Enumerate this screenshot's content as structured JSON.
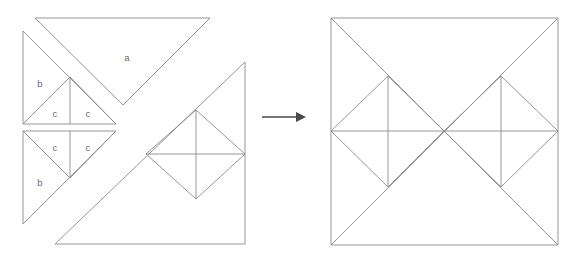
{
  "figure": {
    "stroke_color": "#8a8a8a",
    "label_color": "#6b6b6b",
    "arrow_color": "#4a4a4a",
    "background": "#ffffff",
    "stroke_width": 0.9,
    "width": 583,
    "height": 263
  },
  "labels": {
    "a": "a",
    "b_top": "b",
    "b_bottom": "b",
    "c_top_left": "c",
    "c_top_right": "c",
    "c_bottom_left": "c",
    "c_bottom_right": "c"
  },
  "label_positions": {
    "a": {
      "x": 127,
      "y": 58
    },
    "b_top": {
      "x": 40,
      "y": 84
    },
    "b_bottom": {
      "x": 40,
      "y": 183
    },
    "c_top_left": {
      "x": 55,
      "y": 114
    },
    "c_top_right": {
      "x": 88,
      "y": 114
    },
    "c_bottom_left": {
      "x": 55,
      "y": 148
    },
    "c_bottom_right": {
      "x": 88,
      "y": 148
    }
  },
  "arrow": {
    "name": "transformation-arrow",
    "direction": "right",
    "x1": 262,
    "y1": 117,
    "x2": 306,
    "y2": 117
  },
  "left_figure": {
    "name": "dissected-pieces",
    "triangle_a": [
      [
        35,
        18
      ],
      [
        210,
        18
      ],
      [
        123,
        105
      ]
    ],
    "triangle_b_top": [
      [
        23,
        31
      ],
      [
        23,
        124
      ],
      [
        116,
        124
      ]
    ],
    "triangle_b_bottom": [
      [
        23,
        131
      ],
      [
        23,
        224
      ],
      [
        116,
        131
      ]
    ],
    "c_top_apex": [
      70,
      77
    ],
    "c_top_base": [
      [
        23,
        124
      ],
      [
        116,
        124
      ]
    ],
    "c_top_vertical": [
      [
        70,
        77
      ],
      [
        70,
        124
      ]
    ],
    "c_bottom_apex": [
      70,
      178
    ],
    "c_bottom_base": [
      [
        23,
        131
      ],
      [
        116,
        131
      ]
    ],
    "c_bottom_vertical": [
      [
        70,
        131
      ],
      [
        70,
        178
      ]
    ],
    "big_triangle": [
      [
        55,
        244
      ],
      [
        245,
        244
      ],
      [
        245,
        62
      ]
    ],
    "long_edge": [
      [
        55,
        244
      ],
      [
        245,
        62
      ]
    ],
    "right_vertical": [
      [
        245,
        62
      ],
      [
        245,
        244
      ]
    ],
    "bottom_edge": [
      [
        55,
        244
      ],
      [
        245,
        244
      ]
    ],
    "diamond": [
      [
        196,
        110
      ],
      [
        245,
        154
      ],
      [
        196,
        199
      ],
      [
        146,
        154
      ]
    ],
    "diamond_vertical": [
      [
        196,
        110
      ],
      [
        196,
        199
      ]
    ],
    "diamond_horizontal": [
      [
        146,
        154
      ],
      [
        245,
        154
      ]
    ]
  },
  "right_figure": {
    "name": "assembled-square",
    "square": [
      [
        331,
        18
      ],
      [
        558,
        18
      ],
      [
        558,
        245
      ],
      [
        331,
        245
      ]
    ],
    "diagonal_tl_br": [
      [
        331,
        18
      ],
      [
        558,
        245
      ]
    ],
    "diagonal_tr_bl": [
      [
        558,
        18
      ],
      [
        331,
        245
      ]
    ],
    "midline_horizontal": [
      [
        331,
        131
      ],
      [
        558,
        131
      ]
    ],
    "left_diamond": [
      [
        388,
        76
      ],
      [
        444,
        131
      ],
      [
        388,
        187
      ],
      [
        331,
        131
      ]
    ],
    "left_diamond_vertical": [
      [
        388,
        76
      ],
      [
        388,
        187
      ]
    ],
    "right_diamond": [
      [
        501,
        76
      ],
      [
        558,
        131
      ],
      [
        501,
        187
      ],
      [
        444,
        131
      ]
    ],
    "right_diamond_vertical": [
      [
        501,
        76
      ],
      [
        501,
        187
      ]
    ]
  }
}
